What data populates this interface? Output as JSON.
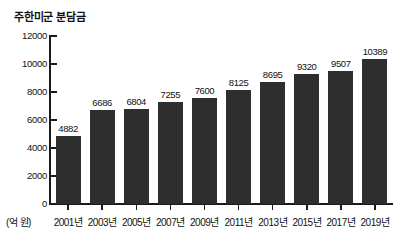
{
  "chart_data": {
    "type": "bar",
    "title": "주한미군 분담금",
    "xlabel": "",
    "ylabel": "",
    "unit_label": "(억 원)",
    "categories": [
      "2001년",
      "2003년",
      "2005년",
      "2007년",
      "2009년",
      "2011년",
      "2013년",
      "2015년",
      "2017년",
      "2019년"
    ],
    "values": [
      4882,
      6686,
      6804,
      7255,
      7600,
      8125,
      8695,
      9320,
      9507,
      10389
    ],
    "value_labels": [
      "4882",
      "6686",
      "6804",
      "7255",
      "7600",
      "8125",
      "8695",
      "9320",
      "9507",
      "10389"
    ],
    "ylim": [
      0,
      12000
    ],
    "ytick_values": [
      0,
      2000,
      4000,
      6000,
      8000,
      10000,
      12000
    ],
    "ytick_labels": [
      "0",
      "2000",
      "4000",
      "6000",
      "8000",
      "10000",
      "12000"
    ],
    "grid": false,
    "legend": false,
    "bar_color": "#2e2e2e",
    "axis_color": "#1a1a1a",
    "background_color": "#ffffff"
  }
}
